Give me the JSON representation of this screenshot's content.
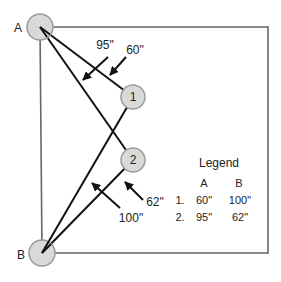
{
  "points": {
    "A": {
      "label": "A"
    },
    "B": {
      "label": "B"
    },
    "p1": {
      "label": "1"
    },
    "p2": {
      "label": "2"
    }
  },
  "measurements": {
    "A_to_2": "95\"",
    "A_to_1": "60\"",
    "B_to_2": "62\"",
    "B_to_1": "100\""
  },
  "legend": {
    "title": "Legend",
    "col_a": "A",
    "col_b": "B",
    "rows": [
      {
        "num": "1.",
        "a": "60\"",
        "b": "100\""
      },
      {
        "num": "2.",
        "a": "95\"",
        "b": "62\""
      }
    ]
  },
  "colors": {
    "circle_fill": "#d9d9d9",
    "circle_stroke": "#9a9a9a",
    "box_stroke": "#666666",
    "line": "#111111"
  }
}
